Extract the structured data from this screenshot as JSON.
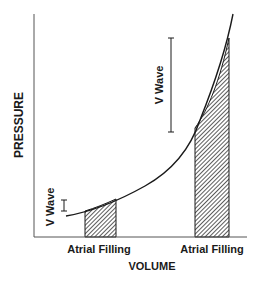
{
  "diagram": {
    "axes": {
      "x_label": "VOLUME",
      "y_label": "PRESSURE"
    },
    "annotations": {
      "v_wave_low": "V Wave",
      "v_wave_high": "V Wave",
      "atrial_filling_left": "Atrial Filling",
      "atrial_filling_right": "Atrial Filling"
    },
    "colors": {
      "line": "#1a1a1a",
      "hatch": "#333333",
      "background": "#ffffff"
    }
  }
}
